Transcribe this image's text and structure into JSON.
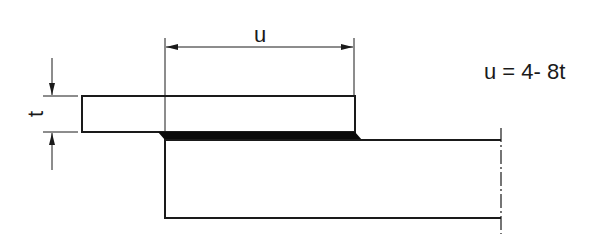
{
  "diagram": {
    "type": "lap-joint-weld",
    "labels": {
      "overlap_dimension": "u",
      "thickness_dimension": "t",
      "formula": "u = 4- 8t"
    },
    "colors": {
      "line": "#1a1a1a",
      "background": "#ffffff",
      "weld_fill": "#0a0a0a"
    }
  }
}
